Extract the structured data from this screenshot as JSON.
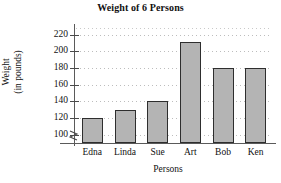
{
  "chart_data": {
    "type": "bar",
    "title": "Weight of 6 Persons",
    "xlabel": "Persons",
    "ylabel": "Weight\n(in pounds)",
    "ylabel_line1": "Weight",
    "ylabel_line2": "(in pounds)",
    "categories": [
      "Edna",
      "Linda",
      "Sue",
      "Art",
      "Bob",
      "Ken"
    ],
    "values": [
      120,
      130,
      140,
      211,
      180,
      180
    ],
    "ylim": [
      90,
      228
    ],
    "yticks": [
      100,
      120,
      140,
      160,
      180,
      200,
      220
    ],
    "ytick_labels": [
      "100",
      "120",
      "140",
      "160",
      "180",
      "200",
      "220"
    ],
    "axis_break": true,
    "grid": true,
    "grid_style": "dotted-horizontal",
    "legend": null,
    "bar_fill_color": "#b4b4b4",
    "bar_edge_color": "#2e2e2e",
    "axis_color": "#5a5a5a",
    "text_color": "#111111",
    "background_color": "#ffffff"
  }
}
